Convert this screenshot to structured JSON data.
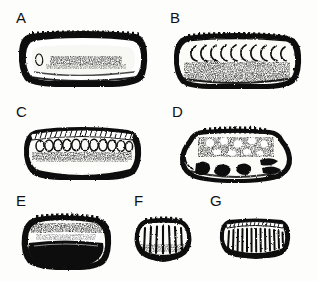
{
  "figure": {
    "kind": "specimen-plate",
    "background_color": "#fdfdfb",
    "ink_color": "#111111",
    "width": 318,
    "height": 281,
    "rows": 3,
    "panel_count": 7
  },
  "panels": [
    {
      "label": "A",
      "label_x": 16,
      "label_y": 10,
      "box": {
        "x": 16,
        "y": 28,
        "w": 134,
        "h": 62
      },
      "shape": "elongate-rounded-rectangle",
      "outline": "thick-dark-band",
      "interior": "light-pale-center",
      "dorsal_ornament": "fine-marginal-denticles",
      "ornament_count": 26,
      "notes": "broad lateral view, heavy dark marginal rim enclosing pale inner field with faint median speckling"
    },
    {
      "label": "B",
      "label_x": 170,
      "label_y": 10,
      "box": {
        "x": 170,
        "y": 28,
        "w": 134,
        "h": 64
      },
      "shape": "elongate-rounded-rectangle",
      "outline": "thin-dark-band",
      "interior": "mottled-stippled",
      "dorsal_ornament": "crescent-row",
      "ornament_count": 10,
      "notes": "row of C-shaped crescents opening right beneath the dorsal margin; lower half coarsely stippled"
    },
    {
      "label": "C",
      "label_x": 16,
      "label_y": 104,
      "box": {
        "x": 20,
        "y": 120,
        "w": 124,
        "h": 62
      },
      "shape": "ovate-rounded-rectangle",
      "outline": "medium-dark-band",
      "interior": "pale-with-median-stipple-band",
      "dorsal_ornament": "oval-loculi-row",
      "ornament_count": 11,
      "notes": "row of oval loculi below a finely hatched dorsal crest; dark basal margin"
    },
    {
      "label": "D",
      "label_x": 172,
      "label_y": 104,
      "box": {
        "x": 176,
        "y": 120,
        "w": 122,
        "h": 66
      },
      "shape": "trapezoidal-rounded",
      "outline": "irregular-dark-band",
      "interior": "blotchy-mottled",
      "dorsal_ornament": "short-denticle-row",
      "ornament_count": 13,
      "notes": "strongly mottled surface with irregular dark blotches and lens-shaped dark markings on the right flank"
    },
    {
      "label": "E",
      "label_x": 16,
      "label_y": 193,
      "box": {
        "x": 18,
        "y": 210,
        "w": 96,
        "h": 62
      },
      "shape": "compact-rounded-rectangle",
      "outline": "thick-dark-band",
      "interior": "pale-upper-solid-dark-lower",
      "dorsal_ornament": "coarse-denticle-row",
      "ornament_count": 14,
      "notes": "compact valve with large solid black crescentic area filling the ventral half"
    },
    {
      "label": "F",
      "label_x": 134,
      "label_y": 193,
      "box": {
        "x": 130,
        "y": 212,
        "w": 66,
        "h": 54
      },
      "shape": "small-rounded-trapezoid",
      "outline": "dark-band",
      "interior": "pale-with-vertical-ribs",
      "dorsal_ornament": "marginal-denticles",
      "ornament_count": 7,
      "notes": "small specimen with about seven coarse vertical ribs and a dark arcuate ventral margin"
    },
    {
      "label": "G",
      "label_x": 210,
      "label_y": 193,
      "box": {
        "x": 216,
        "y": 214,
        "w": 78,
        "h": 50
      },
      "shape": "small-rounded-rectangle",
      "outline": "dark-band",
      "interior": "pale-with-close-vertical-ribs",
      "dorsal_ornament": "fine-dorsal-hatching",
      "ornament_count": 13,
      "notes": "closely spaced vertical ribs across the whole lateral face"
    }
  ]
}
